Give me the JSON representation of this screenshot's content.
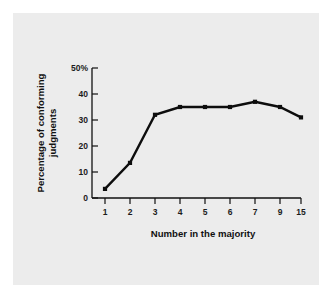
{
  "chart_data": {
    "type": "line",
    "title": "",
    "subtitle": "",
    "xlabel": "Number in the majority",
    "ylabel": "Percentage of conforming judgments",
    "ylabel_lines": [
      "Percentage of conforming",
      "judgments"
    ],
    "categories": [
      "1",
      "2",
      "3",
      "4",
      "5",
      "6",
      "7",
      "9",
      "15"
    ],
    "values": [
      3.5,
      13.5,
      32,
      35,
      35,
      35,
      37,
      35,
      31
    ],
    "xtick_labels": [
      "1",
      "2",
      "3",
      "4",
      "5",
      "6",
      "7",
      "9",
      "15"
    ],
    "ytick_labels": [
      "0",
      "10",
      "20",
      "30",
      "40",
      "50%"
    ],
    "ytick_values": [
      0,
      10,
      20,
      30,
      40,
      50
    ],
    "ylim": [
      0,
      50
    ],
    "grid": false,
    "legend": false,
    "legend_position": "none",
    "marker": "square",
    "line_color": "#0d0d0d",
    "panel_color": "#ececec",
    "page_color": "#ffffff",
    "axis_color": "#111111"
  }
}
